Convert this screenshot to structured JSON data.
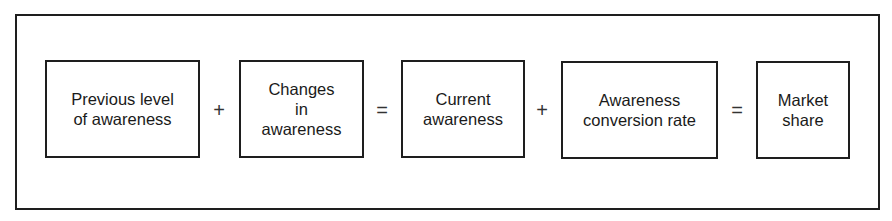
{
  "diagram": {
    "title": "",
    "boxes": [
      {
        "id": "previous-level-of-awareness",
        "label": "Previous level\nof awareness"
      },
      {
        "id": "changes-in-awareness",
        "label": "Changes\nin\nawareness"
      },
      {
        "id": "current-awareness",
        "label": "Current\nawareness"
      },
      {
        "id": "awareness-conversion-rate",
        "label": "Awareness\nconversion rate"
      },
      {
        "id": "market-share",
        "label": "Market\nshare"
      }
    ],
    "operators": [
      "+",
      "=",
      "+",
      "="
    ],
    "colors": {
      "stroke": "#1e1e1e",
      "text": "#1a1a1a",
      "background": "#ffffff"
    }
  }
}
